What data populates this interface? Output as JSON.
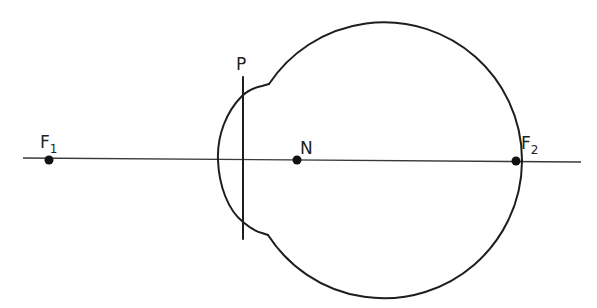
{
  "diagram": {
    "type": "reduced-eye schematic",
    "colors": {
      "stroke": "#1e1e1e",
      "axis": "#3a3a3a",
      "point": "#111111",
      "background": "#ffffff"
    },
    "labels": {
      "f1_main": "F",
      "f1_sub": "1",
      "f2_main": "F",
      "f2_sub": "2",
      "n": "N",
      "p": "P"
    },
    "points": [
      {
        "id": "F1",
        "x": 49,
        "y": 160
      },
      {
        "id": "N",
        "x": 297,
        "y": 160
      },
      {
        "id": "F2",
        "x": 516,
        "y": 161
      }
    ],
    "optical_axis": {
      "x1": 23,
      "y1": 158,
      "x2": 581,
      "y2": 162
    },
    "principal_plane": {
      "x": 243,
      "y1": 77,
      "y2": 239
    },
    "eyeball": {
      "cx": 380,
      "cy": 160,
      "r": 138
    },
    "cornea": {
      "left_x": 218,
      "top": [
        269,
        84
      ],
      "bottom": [
        268,
        235
      ]
    }
  }
}
